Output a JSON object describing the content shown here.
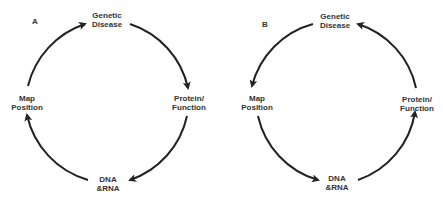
{
  "panels": [
    {
      "id": "A",
      "letter": "A",
      "direction": "clockwise",
      "nodes": {
        "top": {
          "line1": "Genetic",
          "line2": "Disease"
        },
        "right": {
          "line1": "Protein/",
          "line2": "Function"
        },
        "bottom": {
          "line1": "DNA",
          "line2": "&RNA"
        },
        "left": {
          "line1": "Map",
          "line2": "Position"
        }
      },
      "cycle": [
        "Genetic Disease",
        "Protein/Function",
        "DNA &RNA",
        "Map Position",
        "Genetic Disease"
      ]
    },
    {
      "id": "B",
      "letter": "B",
      "direction": "counterclockwise",
      "nodes": {
        "top": {
          "line1": "Genetic",
          "line2": "Disease"
        },
        "right": {
          "line1": "Protein/",
          "line2": "Function"
        },
        "bottom": {
          "line1": "DNA",
          "line2": "&RNA"
        },
        "left": {
          "line1": "Map",
          "line2": "Position"
        }
      },
      "cycle": [
        "Genetic Disease",
        "Map Position",
        "DNA &RNA",
        "Protein/Function",
        "Genetic Disease"
      ]
    }
  ],
  "colors": {
    "arrow": "#222222",
    "text": "#333333",
    "background": "#ffffff"
  }
}
